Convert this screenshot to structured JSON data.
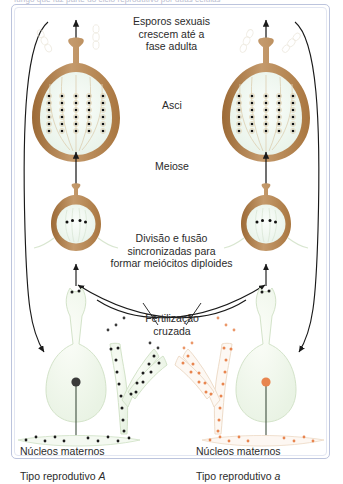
{
  "figure": {
    "top_caption_clipped": "fungo que faz parte do ciclo reprodutivo por duas células",
    "frame_color": "#bcc4dd",
    "background": "#ffffff"
  },
  "labels": {
    "spores": "Esporos sexuais\ncrescem até a\nfase adulta",
    "asci": "Asci",
    "meiosis": "Meiose",
    "division": "Divisão e fusão\nsincronizadas para\nformar meiócitos diploides",
    "fertilization": "Fertilização\ncruzada",
    "maternal_left_line1": "Núcleos maternos",
    "maternal_left_line2": "Tipo reprodutivo ",
    "maternal_left_type": "A",
    "maternal_right_line1": "Núcleos maternos",
    "maternal_right_line2": "Tipo reprodutivo ",
    "maternal_right_type": "a"
  },
  "colors": {
    "perithecium_wall": "#a9763f",
    "perithecium_wall_light": "#c49a6c",
    "perithecium_interior": "#eef6ef",
    "ascus_outline": "#e8d9bd",
    "spore_dark": "#101010",
    "nucleus_dark": "#3a3a3a",
    "nucleus_orange": "#e8854f",
    "hypha_fill": "#f2f8ef",
    "hypha_outline": "#cfe0c4",
    "arrow": "#1a1a1a",
    "text": "#2b2b2b"
  },
  "structures": {
    "perithecium_left": {
      "mating_type": "A",
      "stage": "mature",
      "ascus_rows": 5
    },
    "perithecium_right": {
      "mating_type": "a",
      "stage": "mature",
      "ascus_rows": 5
    },
    "protoperithecium_left": {
      "mating_type": "A",
      "stage": "croziers",
      "nuclei_pairs": 2
    },
    "protoperithecium_right": {
      "mating_type": "a",
      "stage": "croziers",
      "nuclei_pairs": 2
    },
    "ascogonium_left": {
      "mating_type": "A",
      "nucleus_color": "#3a3a3a"
    },
    "ascogonium_right": {
      "mating_type": "a",
      "nucleus_color": "#e8854f"
    },
    "conidiophore_left": {
      "mating_type": "A",
      "nucleus_color": "#1b1b1b",
      "branches": 3
    },
    "conidiophore_right": {
      "mating_type": "a",
      "nucleus_color": "#e8854f",
      "branches": 3
    }
  },
  "arrows": {
    "meiosis_left": "up",
    "meiosis_right": "up",
    "growth_left": "up",
    "growth_right": "up",
    "fusion_left": "up",
    "fusion_right": "up",
    "cross_left_to_right": "curved",
    "cross_right_to_left": "curved",
    "cycle_left": "curved-down",
    "cycle_right": "curved-down"
  }
}
